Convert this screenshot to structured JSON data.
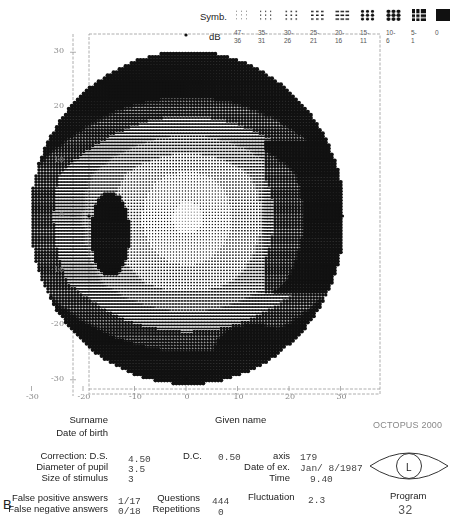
{
  "legend": {
    "symb_label": "Symb.",
    "db_label": "dB",
    "ranges": [
      "47-\n36",
      "35-\n31",
      "30-\n26",
      "25-\n21",
      "20-\n16",
      "15-\n11",
      "10-\n6",
      "5-\n1",
      "0"
    ],
    "symbols": [
      "sparse-dots",
      "small-dots",
      "medium-dots",
      "dense-dots",
      "dashes",
      "bold-dots",
      "large-dots",
      "grid",
      "solid"
    ]
  },
  "chart_data": {
    "type": "heatmap",
    "xlabel": "",
    "ylabel": "",
    "x_ticks": [
      -30,
      -20,
      -10,
      0,
      10,
      20,
      30
    ],
    "y_ticks": [
      30,
      20,
      10,
      0,
      -10,
      -20,
      -30
    ],
    "xlim": [
      -30,
      30
    ],
    "ylim": [
      -30,
      30
    ],
    "field_radius_deg": 30,
    "legend_scale_db": [
      "47-36",
      "35-31",
      "30-26",
      "25-21",
      "20-16",
      "15-11",
      "10-6",
      "5-1",
      "0"
    ],
    "regions": [
      {
        "name": "central",
        "location": "center",
        "sensitivity": "high (lightest symbols)"
      },
      {
        "name": "blind-spot",
        "x": -15,
        "y": -3,
        "sensitivity": "low (dark vertical cluster)"
      },
      {
        "name": "superior-periphery",
        "location": "upper rim",
        "sensitivity": "reduced (dark bold dots)"
      },
      {
        "name": "inferior-periphery",
        "location": "lower rim",
        "sensitivity": "reduced (dark bold dots)"
      },
      {
        "name": "right-nasal-band",
        "x": 22,
        "y": 0,
        "sensitivity": "reduced (bold dots)"
      },
      {
        "name": "inferior-right-defect",
        "x": 15,
        "y": -22,
        "sensitivity": "reduced (bold dots)"
      }
    ],
    "grid_on": false
  },
  "patient": {
    "surname_label": "Surname",
    "dob_label": "Date of birth",
    "given_name_label": "Given name",
    "brand": "OCTOPUS 2000"
  },
  "exam": {
    "correction_ds_label": "Correction: D.S.",
    "correction_ds": "4.50",
    "dc_label": "D.C.",
    "dc": "0.50",
    "axis_label": "axis",
    "axis": "179",
    "pupil_label": "Diameter of pupil",
    "pupil": "3.5",
    "date_label": "Date of ex.",
    "date": "Jan/ 8/1987",
    "stimulus_label": "Size of stimulus",
    "stimulus": "3",
    "time_label": "Time",
    "time": "9.40",
    "fp_label": "False positive answers",
    "fp": "1/17",
    "fn_label": "False negative answers",
    "fn": "0/18",
    "questions_label": "Questions",
    "questions": "444",
    "repetitions_label": "Repetitions",
    "repetitions": "0",
    "fluctuation_label": "Fluctuation",
    "fluctuation": "2.3",
    "program_label": "Program",
    "program": "32",
    "eye": "L"
  },
  "figure_label": "B"
}
